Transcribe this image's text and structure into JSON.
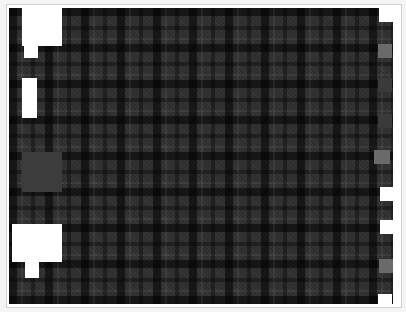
{
  "canvas": {
    "pattern": "tartan",
    "base_color": "#2e2e2e"
  },
  "colors": {
    "frame_border": "#d0d0d0",
    "block_white": "#ffffff",
    "block_grey": "#3c3c3c",
    "swatch_mid_grey": "#6a6a6a",
    "swatch_dark_grey": "#3a3a3a"
  },
  "left_blocks": [
    {
      "id": "top-left-block",
      "shape": "T-shape",
      "color": "#ffffff"
    },
    {
      "id": "middle-left-bar",
      "shape": "rectangle",
      "color": "#ffffff"
    },
    {
      "id": "grey-square",
      "shape": "square",
      "color": "#3c3c3c"
    },
    {
      "id": "bottom-left-block",
      "shape": "T-shape",
      "color": "#ffffff"
    }
  ],
  "right_swatches": [
    {
      "color": "#ffffff"
    },
    {
      "color": "#6a6a6a"
    },
    {
      "color": "#3a3a3a"
    },
    {
      "color": "#3a3a3a"
    },
    {
      "color": "#6a6a6a"
    },
    {
      "color": "#ffffff"
    },
    {
      "color": "#ffffff"
    },
    {
      "color": "#6a6a6a"
    },
    {
      "color": "#ffffff"
    }
  ]
}
